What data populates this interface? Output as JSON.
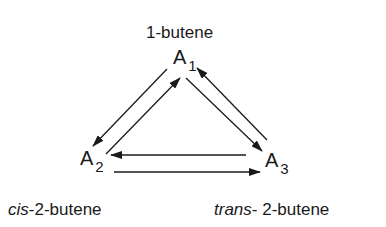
{
  "diagram": {
    "nodes": [
      {
        "id": "A1",
        "symbol": "A",
        "subscript": "1",
        "name": "1-butene"
      },
      {
        "id": "A2",
        "symbol": "A",
        "subscript": "2",
        "name_prefix": "cis",
        "name_suffix": "-2-butene"
      },
      {
        "id": "A3",
        "symbol": "A",
        "subscript": "3",
        "name_prefix": "trans",
        "name_suffix": " - 2-butene"
      }
    ],
    "edges": [
      {
        "from": "A1",
        "to": "A2"
      },
      {
        "from": "A2",
        "to": "A1"
      },
      {
        "from": "A1",
        "to": "A3"
      },
      {
        "from": "A3",
        "to": "A1"
      },
      {
        "from": "A3",
        "to": "A2"
      },
      {
        "from": "A2",
        "to": "A3"
      }
    ],
    "colors": {
      "line": "#1a1a1a",
      "background": "#ffffff"
    }
  },
  "labels": {
    "a1_name": "1-butene",
    "a1_symbol": "A",
    "a1_sub": "1",
    "a2_symbol": "A",
    "a2_sub": "2",
    "a3_symbol": "A",
    "a3_sub": "3",
    "a2_prefix": "cis",
    "a2_suffix": "-2-butene",
    "a3_prefix": "trans",
    "a3_suffix": "- 2-butene"
  }
}
